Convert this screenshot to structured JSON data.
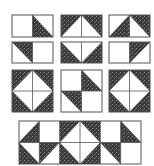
{
  "figure": {
    "colors": {
      "background": "#ffffff",
      "dark": "#3a3a3a",
      "outline": "#555555"
    },
    "blocks": [
      {
        "id": "r1c1",
        "x": 12,
        "y": 15,
        "w": 41,
        "h": 22,
        "cols": 2,
        "rows": 1,
        "cells": [
          "white",
          "dark-lower-left"
        ]
      },
      {
        "id": "r1c2",
        "x": 61,
        "y": 15,
        "w": 41,
        "h": 22,
        "cols": 2,
        "rows": 1,
        "cells": [
          "dark-upper-left",
          "dark-upper-right"
        ]
      },
      {
        "id": "r1c3",
        "x": 109,
        "y": 15,
        "w": 41,
        "h": 22,
        "cols": 2,
        "rows": 1,
        "cells": [
          "dark-lower-right",
          "dark-upper-right"
        ]
      },
      {
        "id": "r2c1",
        "x": 12,
        "y": 42,
        "w": 41,
        "h": 21,
        "cols": 2,
        "rows": 1,
        "cells": [
          "dark-upper-right",
          "white"
        ]
      },
      {
        "id": "r2c2",
        "x": 61,
        "y": 42,
        "w": 41,
        "h": 21,
        "cols": 2,
        "rows": 1,
        "cells": [
          "dark-lower-left",
          "dark-lower-right"
        ]
      },
      {
        "id": "r2c3",
        "x": 109,
        "y": 42,
        "w": 41,
        "h": 21,
        "cols": 2,
        "rows": 1,
        "cells": [
          "white",
          "dark-upper-left"
        ]
      },
      {
        "id": "r3c1",
        "x": 12,
        "y": 70,
        "w": 41,
        "h": 42,
        "cols": 2,
        "rows": 2,
        "cells": [
          "dark-upper-left",
          "dark-upper-right",
          "dark-lower-left",
          "dark-lower-right"
        ]
      },
      {
        "id": "r3c2",
        "x": 61,
        "y": 70,
        "w": 41,
        "h": 42,
        "cols": 2,
        "rows": 2,
        "cells": [
          "white",
          "dark-lower-left",
          "dark-upper-right",
          "white"
        ]
      },
      {
        "id": "r3c3",
        "x": 109,
        "y": 70,
        "w": 41,
        "h": 42,
        "cols": 2,
        "rows": 2,
        "cells": [
          "dark-upper-left",
          "dark-upper-right",
          "dark-lower-left",
          "dark-lower-right"
        ]
      },
      {
        "id": "r4-strip",
        "x": 19,
        "y": 121,
        "w": 122,
        "h": 43,
        "cols": 6,
        "rows": 2,
        "cells": [
          "dark-lower-right",
          "white",
          "dark-upper-left",
          "dark-upper-right",
          "white",
          "dark-lower-left",
          "dark-lower-left",
          "dark-upper-left",
          "dark-lower-left",
          "dark-lower-right",
          "dark-upper-right",
          "white"
        ]
      }
    ]
  }
}
